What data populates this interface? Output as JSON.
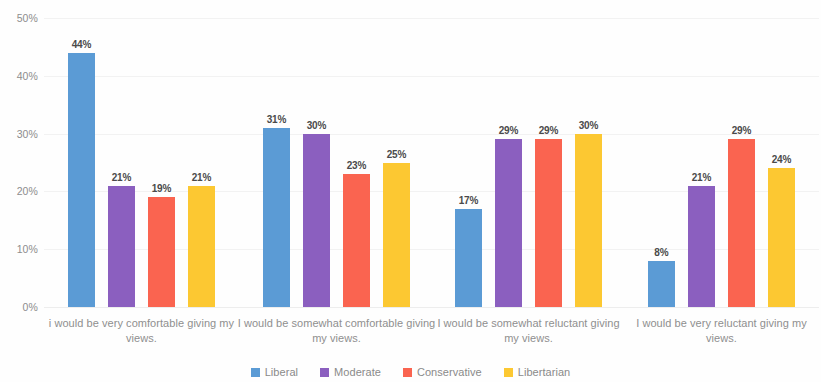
{
  "chart_data": {
    "type": "bar",
    "title": "",
    "subtitle": "",
    "xlabel": "",
    "ylabel": "",
    "ylim": [
      0,
      50
    ],
    "ytick_labels": [
      "0%",
      "10%",
      "20%",
      "30%",
      "40%",
      "50%"
    ],
    "ytick_values": [
      0,
      10,
      20,
      30,
      40,
      50
    ],
    "grid": true,
    "grid_axis": "y",
    "legend_position": "bottom-center",
    "value_labels_shown": true,
    "value_label_suffix": "%",
    "categories": [
      "i would be very comfortable giving my views.",
      "I would be somewhat comfortable giving my views.",
      "I would be somewhat reluctant giving my views.",
      "I would be very reluctant giving my views."
    ],
    "series": [
      {
        "name": "Liberal",
        "color": "#5B9BD5",
        "values": [
          44,
          31,
          17,
          8
        ],
        "value_labels": [
          "44%",
          "31%",
          "17%",
          "8%"
        ]
      },
      {
        "name": "Moderate",
        "color": "#8B5FBF",
        "values": [
          21,
          30,
          29,
          21
        ],
        "value_labels": [
          "21%",
          "30%",
          "29%",
          "21%"
        ]
      },
      {
        "name": "Conservative",
        "color": "#FA6450",
        "values": [
          19,
          23,
          29,
          29
        ],
        "value_labels": [
          "19%",
          "23%",
          "29%",
          "29%"
        ]
      },
      {
        "name": "Libertarian",
        "color": "#FCC832",
        "values": [
          21,
          25,
          30,
          24
        ],
        "value_labels": [
          "21%",
          "25%",
          "30%",
          "24%"
        ]
      }
    ]
  }
}
